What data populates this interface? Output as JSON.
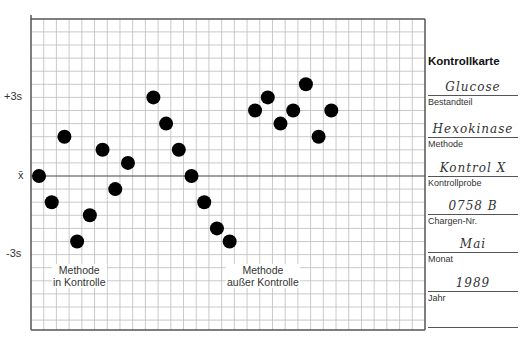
{
  "chart_data": {
    "type": "scatter",
    "title": "Kontrollkarte",
    "xlabel": "",
    "ylabel": "",
    "grid": true,
    "y_reference_lines": [
      {
        "label": "+3s",
        "value": 3
      },
      {
        "label": "x̄",
        "value": 0
      },
      {
        "label": "-3s",
        "value": -3
      }
    ],
    "ylim": [
      -6,
      6
    ],
    "xlim": [
      0,
      31
    ],
    "series": [
      {
        "name": "Methode in Kontrolle",
        "points": [
          {
            "x": 0.5,
            "y": 0.0
          },
          {
            "x": 1.5,
            "y": -1.0
          },
          {
            "x": 2.5,
            "y": 1.5
          },
          {
            "x": 3.5,
            "y": -2.5
          },
          {
            "x": 4.5,
            "y": -1.5
          },
          {
            "x": 5.5,
            "y": 1.0
          },
          {
            "x": 6.5,
            "y": -0.5
          },
          {
            "x": 7.5,
            "y": 0.5
          }
        ]
      },
      {
        "name": "Methode außer Kontrolle",
        "points": [
          {
            "x": 9.5,
            "y": 3.0
          },
          {
            "x": 10.5,
            "y": 2.0
          },
          {
            "x": 11.5,
            "y": 1.0
          },
          {
            "x": 12.5,
            "y": 0.0
          },
          {
            "x": 13.5,
            "y": -1.0
          },
          {
            "x": 14.5,
            "y": -2.0
          },
          {
            "x": 15.5,
            "y": -2.5
          },
          {
            "x": 17.5,
            "y": 2.5
          },
          {
            "x": 18.5,
            "y": 3.0
          },
          {
            "x": 19.5,
            "y": 2.0
          },
          {
            "x": 20.5,
            "y": 2.5
          },
          {
            "x": 21.5,
            "y": 3.5
          },
          {
            "x": 22.5,
            "y": 1.5
          },
          {
            "x": 23.5,
            "y": 2.5
          }
        ]
      }
    ],
    "annotations": [
      {
        "text": "Methode\nin Kontrolle"
      },
      {
        "text": "Methode\naußer Kontrolle"
      }
    ]
  },
  "axis": {
    "plus3s": "+3s",
    "mean": "x̄",
    "minus3s": "-3s"
  },
  "notes": {
    "in_control_line1": "Methode",
    "in_control_line2": "in Kontrolle",
    "out_control_line1": "Methode",
    "out_control_line2": "außer Kontrolle"
  },
  "sidebar": {
    "title": "Kontrollkarte",
    "fields": [
      {
        "value": "Glucose",
        "label": "Bestandteil"
      },
      {
        "value": "Hexokinase",
        "label": "Methode"
      },
      {
        "value": "Kontrol X",
        "label": "Kontrollprobe"
      },
      {
        "value": "0758 B",
        "label": "Chargen-Nr."
      },
      {
        "value": "Mai",
        "label": "Monat"
      },
      {
        "value": "1989",
        "label": "Jahr"
      }
    ]
  },
  "colors": {
    "grid": "#bdbdbd",
    "border": "#555555",
    "point": "#000000"
  }
}
